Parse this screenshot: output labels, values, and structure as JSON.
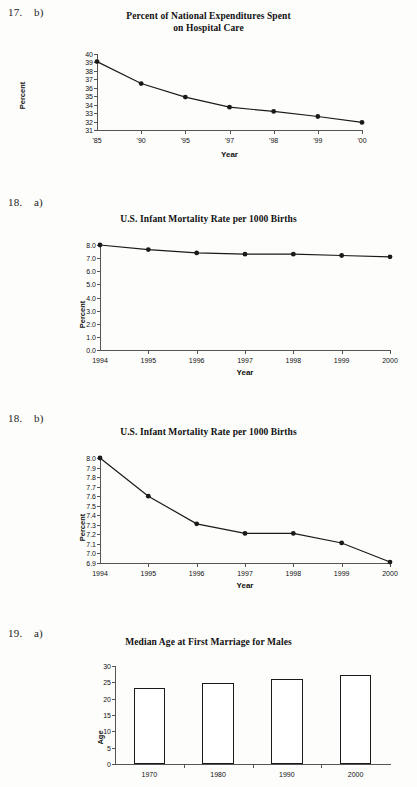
{
  "problems": [
    {
      "number": "17.",
      "part": "b)"
    },
    {
      "number": "18.",
      "part": "a)"
    },
    {
      "number": "18.",
      "part": "b)"
    },
    {
      "number": "19.",
      "part": "a)"
    }
  ],
  "chart_data": [
    {
      "type": "line",
      "title": "Percent of National Expenditures Spent\non Hospital Care",
      "title_line1": "Percent of National Expenditures Spent",
      "title_line2": "on Hospital Care",
      "xlabel": "Year",
      "ylabel": "Percent",
      "categories": [
        "'85",
        "'90",
        "'95",
        "'97",
        "'98",
        "'99",
        "'00"
      ],
      "values": [
        39.1,
        36.5,
        34.9,
        33.7,
        33.2,
        32.6,
        31.9
      ],
      "yticks": [
        31,
        32,
        33,
        34,
        35,
        36,
        37,
        38,
        39,
        40
      ],
      "ylim": [
        31,
        40
      ],
      "grid": false,
      "marker": "filled-circle"
    },
    {
      "type": "line",
      "title": "U.S. Infant Mortality Rate per 1000 Births",
      "title_line1": "U.S. Infant Mortality Rate per 1000 Births",
      "title_line2": "",
      "xlabel": "Year",
      "ylabel": "Percent",
      "categories": [
        "1994",
        "1995",
        "1996",
        "1997",
        "1998",
        "1999",
        "2000"
      ],
      "values": [
        8.0,
        7.65,
        7.4,
        7.3,
        7.3,
        7.2,
        7.1
      ],
      "yticks": [
        "0.0",
        "1.0",
        "2.0",
        "3.0",
        "4.0",
        "5.0",
        "6.0",
        "7.0",
        "8.0"
      ],
      "ylim": [
        0,
        8
      ],
      "grid": false,
      "marker": "filled-circle"
    },
    {
      "type": "line",
      "title": "U.S. Infant Mortality Rate per 1000 Births",
      "title_line1": "U.S. Infant Mortality Rate per 1000 Births",
      "title_line2": "",
      "xlabel": "Year",
      "ylabel": "Percent",
      "categories": [
        "1994",
        "1995",
        "1996",
        "1997",
        "1998",
        "1999",
        "2000"
      ],
      "values": [
        8.0,
        7.6,
        7.31,
        7.21,
        7.21,
        7.11,
        6.91
      ],
      "yticks": [
        "6.9",
        "7.0",
        "7.1",
        "7.2",
        "7.3",
        "7.4",
        "7.5",
        "7.6",
        "7.7",
        "7.8",
        "7.9",
        "8.0"
      ],
      "ylim": [
        6.9,
        8.0
      ],
      "grid": false,
      "marker": "filled-circle"
    },
    {
      "type": "bar",
      "title": "Median Age at First Marriage for Males",
      "title_line1": "Median Age at First Marriage for Males",
      "title_line2": "",
      "xlabel": "",
      "ylabel": "Age",
      "categories": [
        "1970",
        "1980",
        "1990",
        "2000"
      ],
      "values": [
        23.2,
        24.9,
        26.1,
        27.1
      ],
      "yticks": [
        0,
        5,
        10,
        15,
        20,
        25,
        30
      ],
      "ylim": [
        0,
        30
      ],
      "grid": false,
      "bar_fill": "#ffffff",
      "bar_stroke": "#1a1a1a"
    }
  ],
  "colors": {
    "ink": "#1a1a1a",
    "axis": "#555555",
    "paper": "#fdfdfc"
  }
}
